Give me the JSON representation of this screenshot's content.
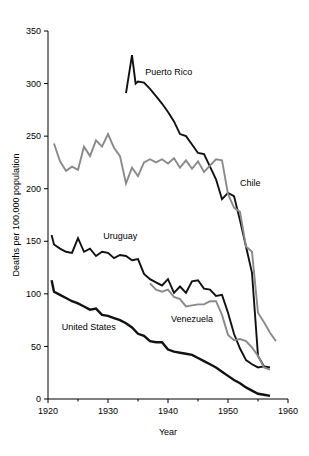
{
  "chart_data": {
    "type": "line",
    "title": "",
    "xlabel": "Year",
    "ylabel": "Deaths per 100,000 population",
    "xlim": [
      1920,
      1960
    ],
    "ylim": [
      0,
      350
    ],
    "xticks": [
      1920,
      1930,
      1940,
      1950,
      1960
    ],
    "xticklabels": [
      "1920",
      "1930",
      "1940",
      "1950",
      "1960"
    ],
    "xminorticks": [
      1925,
      1935,
      1945,
      1955
    ],
    "yticks": [
      0,
      50,
      100,
      150,
      200,
      250,
      300,
      350
    ],
    "yticklabels": [
      "0",
      "50",
      "100",
      "150",
      "200",
      "250",
      "300",
      "350"
    ],
    "grid": false,
    "legend": "inline-annotations",
    "series": [
      {
        "name": "Puerto Rico",
        "color": "#111111",
        "width": 1.9,
        "label_x": 1936.2,
        "label_y": 308,
        "x": [
          1933,
          1934,
          1934.6,
          1935,
          1936,
          1937,
          1938,
          1939,
          1940,
          1941,
          1942,
          1943,
          1944,
          1945,
          1946,
          1947,
          1948,
          1949,
          1950,
          1951,
          1952,
          1953,
          1954,
          1955,
          1956,
          1957
        ],
        "y": [
          291,
          327,
          300,
          302,
          301,
          295,
          288,
          281,
          273,
          264,
          252,
          250,
          242,
          234,
          233,
          221,
          209,
          190,
          196,
          193,
          170,
          145,
          120,
          41,
          31,
          30
        ]
      },
      {
        "name": "Chile",
        "color": "#8a8a8a",
        "width": 1.9,
        "label_x": 1952.0,
        "label_y": 203,
        "x": [
          1921,
          1922,
          1923,
          1924,
          1925,
          1926,
          1927,
          1928,
          1929,
          1930,
          1931,
          1932,
          1933,
          1934,
          1935,
          1936,
          1937,
          1938,
          1939,
          1940,
          1941,
          1942,
          1943,
          1944,
          1945,
          1946,
          1947,
          1948,
          1949,
          1950,
          1951,
          1952,
          1953,
          1954,
          1955,
          1956,
          1957,
          1958
        ],
        "y": [
          243,
          226,
          217,
          221,
          218,
          240,
          231,
          246,
          240,
          252,
          239,
          231,
          205,
          220,
          212,
          225,
          228,
          225,
          228,
          224,
          229,
          220,
          227,
          219,
          226,
          216,
          222,
          228,
          227,
          195,
          182,
          178,
          145,
          140,
          82,
          73,
          63,
          55
        ]
      },
      {
        "name": "Uruguay",
        "color": "#111111",
        "width": 1.9,
        "label_x": 1929.2,
        "label_y": 152,
        "x": [
          1920.6,
          1921,
          1922,
          1923,
          1924,
          1925,
          1926,
          1927,
          1928,
          1929,
          1930,
          1931,
          1932,
          1933,
          1934,
          1935,
          1936,
          1937,
          1938,
          1939,
          1940,
          1941,
          1942,
          1943,
          1944,
          1945,
          1946,
          1947,
          1948,
          1949,
          1950,
          1951,
          1952,
          1953,
          1954,
          1955,
          1956
        ],
        "y": [
          156,
          147,
          143,
          140,
          139,
          153,
          140,
          143,
          136,
          140,
          139,
          134,
          137,
          136,
          132,
          133,
          119,
          114,
          111,
          108,
          114,
          101,
          107,
          101,
          112,
          113,
          105,
          104,
          98,
          99,
          82,
          62,
          48,
          37,
          33,
          30,
          31
        ]
      },
      {
        "name": "Venezuela",
        "color": "#8a8a8a",
        "width": 1.9,
        "label_x": 1940.5,
        "label_y": 73,
        "x": [
          1937,
          1938,
          1939,
          1940,
          1941,
          1942,
          1943,
          1944,
          1945,
          1946,
          1947,
          1948,
          1949,
          1950,
          1951,
          1952,
          1953,
          1954,
          1955,
          1956,
          1957
        ],
        "y": [
          110,
          104,
          102,
          104,
          97,
          95,
          88,
          89,
          90,
          90,
          93,
          93,
          80,
          61,
          56,
          57,
          55,
          49,
          41,
          30,
          28
        ]
      },
      {
        "name": "United States",
        "color": "#111111",
        "width": 2.4,
        "label_x": 1922.3,
        "label_y": 66,
        "x": [
          1920.6,
          1921,
          1922,
          1923,
          1924,
          1925,
          1926,
          1927,
          1928,
          1929,
          1930,
          1931,
          1932,
          1933,
          1934,
          1935,
          1936,
          1937,
          1938,
          1939,
          1940,
          1941,
          1942,
          1943,
          1944,
          1945,
          1946,
          1947,
          1948,
          1949,
          1950,
          1951,
          1952,
          1953,
          1954,
          1955,
          1956,
          1957
        ],
        "y": [
          113,
          102,
          99,
          96,
          93,
          91,
          88,
          85,
          86,
          80,
          79,
          77,
          75,
          72,
          68,
          62,
          60,
          55,
          54,
          54,
          47,
          45,
          44,
          43,
          42,
          39,
          36,
          33,
          30,
          26,
          22,
          18,
          15,
          11,
          8,
          5,
          4,
          3
        ]
      }
    ]
  }
}
